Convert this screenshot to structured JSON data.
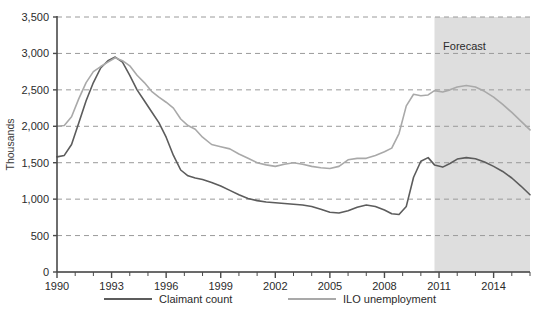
{
  "chart_data": {
    "type": "line",
    "title": "",
    "xlabel": "",
    "ylabel": "Thousands",
    "xlim": [
      1990,
      2016
    ],
    "ylim": [
      0,
      3500
    ],
    "ytick_labels": [
      "0",
      "500",
      "1,000",
      "1,500",
      "2,000",
      "2,500",
      "3,000",
      "3,500"
    ],
    "ytick_values": [
      0,
      500,
      1000,
      1500,
      2000,
      2500,
      3000,
      3500
    ],
    "xtick_labels": [
      "1990",
      "1993",
      "1996",
      "1999",
      "2002",
      "2005",
      "2008",
      "2011",
      "2014"
    ],
    "xtick_values": [
      1990,
      1993,
      1996,
      1999,
      2002,
      2005,
      2008,
      2011,
      2014
    ],
    "grid": true,
    "grid_style": "dashed",
    "grid_color": "#9a9a9a",
    "legend_position": "bottom",
    "annotations": [
      {
        "text": "Forecast",
        "x": 2012.4,
        "y": 3050,
        "type": "shaded-region-label"
      }
    ],
    "shaded_region": {
      "label": "Forecast",
      "x_start": 2010.75,
      "x_end": 2016,
      "color": "#dedede"
    },
    "series": [
      {
        "name": "Claimant count",
        "color": "#5c5c5c",
        "x": [
          1990.0,
          1990.4,
          1990.8,
          1991.2,
          1991.6,
          1992.0,
          1992.4,
          1992.8,
          1993.2,
          1993.6,
          1994.0,
          1994.4,
          1994.8,
          1995.2,
          1995.6,
          1996.0,
          1996.4,
          1996.8,
          1997.2,
          1997.6,
          1998.0,
          1998.5,
          1999.0,
          1999.5,
          2000.0,
          2000.5,
          2001.0,
          2001.5,
          2002.0,
          2002.5,
          2003.0,
          2003.5,
          2004.0,
          2004.5,
          2005.0,
          2005.5,
          2006.0,
          2006.5,
          2007.0,
          2007.5,
          2008.0,
          2008.4,
          2008.8,
          2009.2,
          2009.6,
          2010.0,
          2010.4,
          2010.75,
          2011.2,
          2011.6,
          2012.0,
          2012.5,
          2013.0,
          2013.5,
          2014.0,
          2014.5,
          2015.0,
          2015.5,
          2016.0
        ],
        "y": [
          1580,
          1600,
          1750,
          2050,
          2350,
          2600,
          2800,
          2900,
          2950,
          2880,
          2700,
          2500,
          2350,
          2200,
          2050,
          1850,
          1600,
          1400,
          1320,
          1290,
          1270,
          1230,
          1180,
          1120,
          1060,
          1010,
          980,
          960,
          950,
          940,
          930,
          920,
          900,
          860,
          820,
          810,
          840,
          890,
          920,
          900,
          850,
          800,
          790,
          900,
          1300,
          1520,
          1570,
          1470,
          1440,
          1490,
          1550,
          1570,
          1555,
          1510,
          1450,
          1380,
          1290,
          1180,
          1060
        ]
      },
      {
        "name": "ILO unemployment",
        "color": "#a9a9a9",
        "x": [
          1990.0,
          1990.4,
          1990.8,
          1991.2,
          1991.6,
          1992.0,
          1992.4,
          1992.8,
          1993.2,
          1993.6,
          1994.0,
          1994.4,
          1994.8,
          1995.2,
          1995.6,
          1996.0,
          1996.4,
          1996.8,
          1997.2,
          1997.6,
          1998.0,
          1998.5,
          1999.0,
          1999.5,
          2000.0,
          2000.5,
          2001.0,
          2001.5,
          2002.0,
          2002.5,
          2003.0,
          2003.5,
          2004.0,
          2004.5,
          2005.0,
          2005.5,
          2006.0,
          2006.5,
          2007.0,
          2007.5,
          2008.0,
          2008.4,
          2008.8,
          2009.2,
          2009.6,
          2010.0,
          2010.4,
          2010.75,
          2011.2,
          2011.6,
          2012.0,
          2012.5,
          2013.0,
          2013.5,
          2014.0,
          2014.5,
          2015.0,
          2015.5,
          2016.0
        ],
        "y": [
          2000,
          2010,
          2130,
          2380,
          2600,
          2750,
          2820,
          2880,
          2940,
          2900,
          2830,
          2700,
          2600,
          2480,
          2400,
          2330,
          2250,
          2100,
          2010,
          1960,
          1850,
          1750,
          1720,
          1690,
          1620,
          1560,
          1500,
          1470,
          1450,
          1480,
          1500,
          1480,
          1450,
          1430,
          1420,
          1450,
          1540,
          1560,
          1560,
          1600,
          1650,
          1700,
          1900,
          2280,
          2440,
          2420,
          2430,
          2490,
          2470,
          2500,
          2540,
          2560,
          2540,
          2480,
          2400,
          2300,
          2190,
          2070,
          1950
        ]
      }
    ]
  },
  "legend": {
    "items": [
      {
        "label": "Claimant count",
        "color": "#5c5c5c"
      },
      {
        "label": "ILO unemployment",
        "color": "#a9a9a9"
      }
    ]
  }
}
